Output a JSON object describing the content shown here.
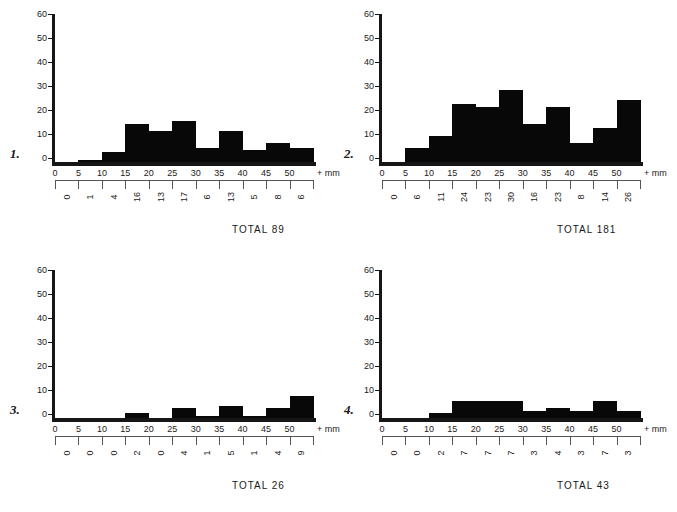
{
  "figure": {
    "background": "#ffffff",
    "ink": "#161616",
    "bar_color": "#080808"
  },
  "axis": {
    "y_ticks": [
      "0",
      "10",
      "20",
      "30",
      "40",
      "50",
      "60"
    ],
    "x_ticks": [
      "0",
      "5",
      "10",
      "15",
      "20",
      "25",
      "30",
      "35",
      "40",
      "45",
      "50"
    ],
    "x_unit": "+ mm",
    "y_max": 60,
    "x_max": 55
  },
  "panels": [
    {
      "index_label": "1.",
      "total_label": "TOTAL 89",
      "chart_data": {
        "type": "bar",
        "title": "1.",
        "xlabel": "+ mm",
        "ylabel": "",
        "categories": [
          "0-5",
          "5-10",
          "10-15",
          "15-20",
          "20-25",
          "25-30",
          "30-35",
          "35-40",
          "40-45",
          "45-50",
          "50-55"
        ],
        "bin_starts": [
          0,
          5,
          10,
          15,
          20,
          25,
          30,
          35,
          40,
          45,
          50
        ],
        "values": [
          0,
          1,
          4,
          16,
          13,
          17,
          6,
          13,
          5,
          8,
          6
        ],
        "total": 89,
        "ylim": [
          0,
          60
        ],
        "xlim": [
          0,
          55
        ],
        "grid": false,
        "legend": "none"
      }
    },
    {
      "index_label": "2.",
      "total_label": "TOTAL 181",
      "chart_data": {
        "type": "bar",
        "title": "2.",
        "xlabel": "+ mm",
        "ylabel": "",
        "categories": [
          "0-5",
          "5-10",
          "10-15",
          "15-20",
          "20-25",
          "25-30",
          "30-35",
          "35-40",
          "40-45",
          "45-50",
          "50-55"
        ],
        "bin_starts": [
          0,
          5,
          10,
          15,
          20,
          25,
          30,
          35,
          40,
          45,
          50
        ],
        "values": [
          0,
          6,
          11,
          24,
          23,
          30,
          16,
          23,
          8,
          14,
          26
        ],
        "total": 181,
        "ylim": [
          0,
          60
        ],
        "xlim": [
          0,
          55
        ],
        "grid": false,
        "legend": "none"
      }
    },
    {
      "index_label": "3.",
      "total_label": "TOTAL 26",
      "chart_data": {
        "type": "bar",
        "title": "3.",
        "xlabel": "+ mm",
        "ylabel": "",
        "categories": [
          "0-5",
          "5-10",
          "10-15",
          "15-20",
          "20-25",
          "25-30",
          "30-35",
          "35-40",
          "40-45",
          "45-50",
          "50-55"
        ],
        "bin_starts": [
          0,
          5,
          10,
          15,
          20,
          25,
          30,
          35,
          40,
          45,
          50
        ],
        "values": [
          0,
          0,
          0,
          2,
          0,
          4,
          1,
          5,
          1,
          4,
          9
        ],
        "total": 26,
        "ylim": [
          0,
          60
        ],
        "xlim": [
          0,
          55
        ],
        "grid": false,
        "legend": "none"
      }
    },
    {
      "index_label": "4.",
      "total_label": "TOTAL 43",
      "chart_data": {
        "type": "bar",
        "title": "4.",
        "xlabel": "+ mm",
        "ylabel": "",
        "categories": [
          "0-5",
          "5-10",
          "10-15",
          "15-20",
          "20-25",
          "25-30",
          "30-35",
          "35-40",
          "40-45",
          "45-50",
          "50-55"
        ],
        "bin_starts": [
          0,
          5,
          10,
          15,
          20,
          25,
          30,
          35,
          40,
          45,
          50
        ],
        "values": [
          0,
          0,
          2,
          7,
          7,
          7,
          3,
          4,
          3,
          7,
          3
        ],
        "total": 43,
        "ylim": [
          0,
          60
        ],
        "xlim": [
          0,
          55
        ],
        "grid": false,
        "legend": "none"
      }
    }
  ]
}
